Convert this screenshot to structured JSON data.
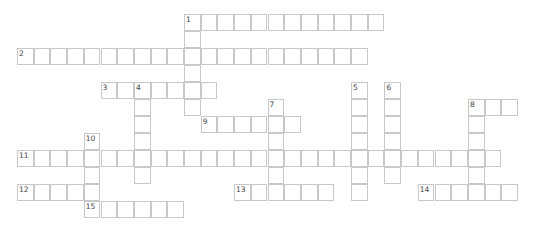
{
  "puzzle": {
    "type": "crossword",
    "cell_size": 16.7,
    "origin": {
      "x": 17,
      "y": 14
    },
    "row_height": 17,
    "colors": {
      "border": "#c8c8c8",
      "number": "#444444",
      "background": "#ffffff"
    }
  },
  "entries": [
    {
      "number": "1",
      "direction": "across",
      "row": 0,
      "col": 10,
      "length": 12
    },
    {
      "number": "1",
      "direction": "down",
      "row": 0,
      "col": 10,
      "length": 6
    },
    {
      "number": "2",
      "direction": "across",
      "row": 2,
      "col": 0,
      "length": 21
    },
    {
      "number": "3",
      "direction": "across",
      "row": 4,
      "col": 5,
      "length": 7
    },
    {
      "number": "4",
      "direction": "down",
      "row": 4,
      "col": 7,
      "length": 6
    },
    {
      "number": "5",
      "direction": "down",
      "row": 4,
      "col": 20,
      "length": 7
    },
    {
      "number": "6",
      "direction": "down",
      "row": 4,
      "col": 22,
      "length": 6
    },
    {
      "number": "7",
      "direction": "down",
      "row": 5,
      "col": 15,
      "length": 6
    },
    {
      "number": "8",
      "direction": "across",
      "row": 5,
      "col": 27,
      "length": 3
    },
    {
      "number": "8",
      "direction": "down",
      "row": 5,
      "col": 27,
      "length": 6
    },
    {
      "number": "9",
      "direction": "across",
      "row": 6,
      "col": 11,
      "length": 6
    },
    {
      "number": "10",
      "direction": "down",
      "row": 7,
      "col": 4,
      "length": 5
    },
    {
      "number": "11",
      "direction": "across",
      "row": 8,
      "col": 0,
      "length": 29
    },
    {
      "number": "12",
      "direction": "across",
      "row": 10,
      "col": 0,
      "length": 5
    },
    {
      "number": "13",
      "direction": "across",
      "row": 10,
      "col": 13,
      "length": 6
    },
    {
      "number": "14",
      "direction": "across",
      "row": 10,
      "col": 24,
      "length": 6
    },
    {
      "number": "15",
      "direction": "across",
      "row": 11,
      "col": 4,
      "length": 6
    }
  ]
}
